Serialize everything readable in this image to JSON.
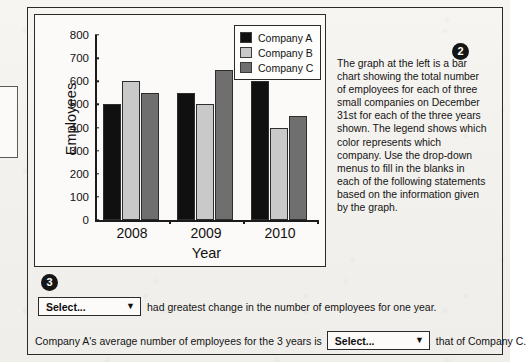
{
  "badges": {
    "one": "1",
    "two": "2",
    "three": "3"
  },
  "chart_data": {
    "type": "bar",
    "title": "",
    "xlabel": "Year",
    "ylabel": "Employees",
    "categories": [
      "2008",
      "2009",
      "2010"
    ],
    "ylim": [
      0,
      800
    ],
    "yticks": [
      0,
      100,
      200,
      300,
      400,
      500,
      600,
      700,
      800
    ],
    "grid": false,
    "legend_position": "top-right",
    "series": [
      {
        "name": "Company A",
        "color": "#101010",
        "values": [
          500,
          550,
          600
        ]
      },
      {
        "name": "Company B",
        "color": "#c9c9c9",
        "values": [
          600,
          500,
          400
        ]
      },
      {
        "name": "Company C",
        "color": "#6f6f6f",
        "values": [
          550,
          650,
          450
        ]
      }
    ]
  },
  "description": "The graph at the left is a bar chart showing the total number of employees for each of three small companies on December 31st for each of the three years shown. The legend shows which color represents which company. Use the drop-down menus to fill in the blanks in each of the following statements based on the information given by the graph.",
  "statements": [
    {
      "dropdown_value": "Select...",
      "caret": "▼",
      "text_after": "had greatest change in the number of employees for one year."
    },
    {
      "text_before": "Company A's average number of employees for the 3 years is",
      "dropdown_value": "Select...",
      "caret": "▼",
      "text_after": "that of Company C."
    }
  ]
}
